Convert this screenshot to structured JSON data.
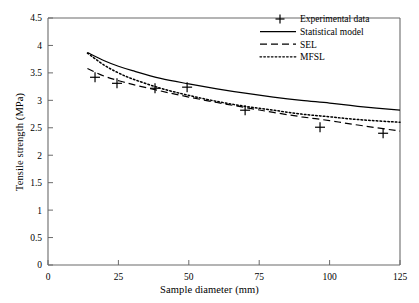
{
  "chart_data": {
    "type": "line",
    "title": "",
    "xlabel": "Sample diameter (mm)",
    "ylabel": "Tensile strength (MPa)",
    "xlim": [
      0,
      125
    ],
    "ylim": [
      0,
      4.5
    ],
    "xticks": [
      "0",
      "25",
      "50",
      "75",
      "100",
      "125"
    ],
    "xtick_values": [
      0,
      25,
      50,
      75,
      100,
      125
    ],
    "yticks": [
      "0",
      "0.5",
      "1",
      "1.5",
      "2",
      "2.5",
      "3",
      "3.5",
      "4",
      "4.5"
    ],
    "ytick_values": [
      0,
      0.5,
      1,
      1.5,
      2,
      2.5,
      3,
      3.5,
      4,
      4.5
    ],
    "grid": false,
    "legend_position": "top-right",
    "series": [
      {
        "name": "Experimental data",
        "style": "marker",
        "marker": "plus",
        "x": [
          16.7,
          24.5,
          38.0,
          49.4,
          70.0,
          96.6,
          119.0
        ],
        "y": [
          3.42,
          3.31,
          3.22,
          3.24,
          2.82,
          2.51,
          2.4
        ]
      },
      {
        "name": "Statistical model",
        "style": "solid",
        "x": [
          14,
          20,
          25,
          30,
          40,
          50,
          60,
          70,
          80,
          90,
          100,
          110,
          125
        ],
        "y": [
          3.87,
          3.72,
          3.62,
          3.54,
          3.4,
          3.3,
          3.21,
          3.13,
          3.06,
          3.0,
          2.95,
          2.89,
          2.82
        ]
      },
      {
        "name": "SEL",
        "style": "dashed",
        "x": [
          14,
          20,
          25,
          30,
          40,
          50,
          60,
          70,
          80,
          90,
          100,
          110,
          125
        ],
        "y": [
          3.58,
          3.44,
          3.36,
          3.29,
          3.17,
          3.06,
          2.96,
          2.87,
          2.78,
          2.7,
          2.63,
          2.55,
          2.44
        ]
      },
      {
        "name": "MFSL",
        "style": "dotted",
        "x": [
          14,
          20,
          25,
          30,
          40,
          50,
          60,
          70,
          80,
          90,
          100,
          110,
          125
        ],
        "y": [
          3.86,
          3.64,
          3.5,
          3.39,
          3.22,
          3.09,
          2.98,
          2.89,
          2.82,
          2.75,
          2.7,
          2.65,
          2.6
        ]
      }
    ]
  },
  "legend": {
    "entries": [
      {
        "label": "Experimental data",
        "symbol": "plus-marker"
      },
      {
        "label": "Statistical model",
        "symbol": "solid-line"
      },
      {
        "label": "SEL",
        "symbol": "dashed-line"
      },
      {
        "label": "MFSL",
        "symbol": "dotted-line"
      }
    ]
  },
  "axes": {
    "x_title": "Sample diameter (mm)",
    "y_title": "Tensile strength (MPa)"
  }
}
